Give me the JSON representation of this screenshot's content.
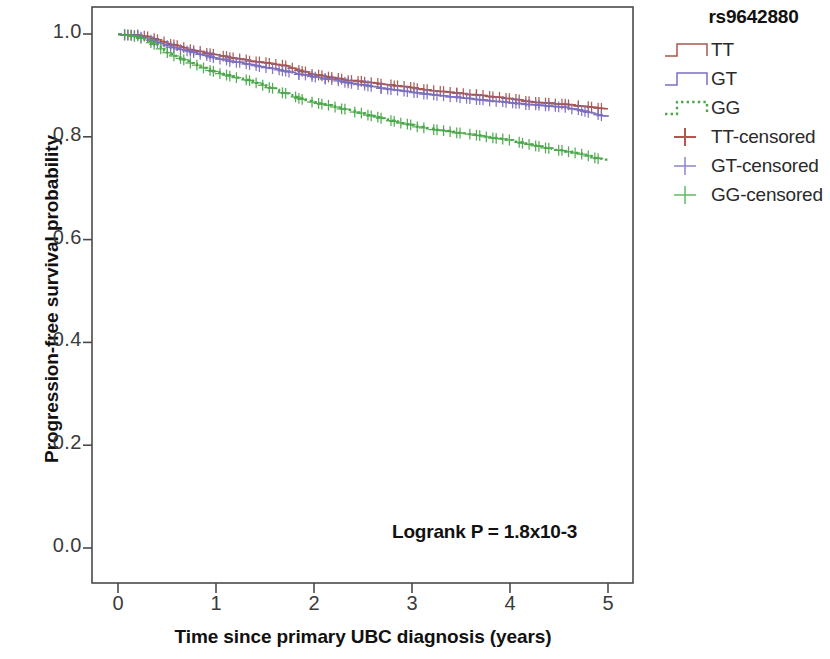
{
  "chart_data": {
    "type": "line",
    "subtype": "kaplan-meier-survival",
    "title": "",
    "xlabel": "Time since primary UBC diagnosis (years)",
    "ylabel": "Progression-free survival probability",
    "xlim": [
      0,
      5
    ],
    "ylim": [
      0.0,
      1.0
    ],
    "xticks": [
      "0",
      "1",
      "2",
      "3",
      "4",
      "5"
    ],
    "yticks": [
      "0.0",
      "0.2",
      "0.4",
      "0.6",
      "0.8",
      "1.0"
    ],
    "grid": false,
    "legend_position": "right",
    "annotation": "Logrank P = 1.8x10-3",
    "legend_title": "rs9642880",
    "series": [
      {
        "name": "TT",
        "color": "#a8554e",
        "style": "solid-step",
        "x": [
          0.0,
          0.18,
          0.3,
          0.42,
          0.55,
          0.7,
          0.85,
          1.0,
          1.15,
          1.3,
          1.45,
          1.6,
          1.72,
          1.85,
          2.0,
          2.15,
          2.3,
          2.45,
          2.6,
          2.75,
          2.9,
          3.05,
          3.2,
          3.35,
          3.5,
          3.65,
          3.8,
          3.95,
          4.1,
          4.25,
          4.4,
          4.55,
          4.7,
          4.85,
          5.0
        ],
        "y": [
          1.0,
          1.0,
          0.995,
          0.988,
          0.98,
          0.972,
          0.966,
          0.96,
          0.955,
          0.95,
          0.946,
          0.942,
          0.938,
          0.93,
          0.922,
          0.917,
          0.912,
          0.909,
          0.906,
          0.902,
          0.899,
          0.895,
          0.891,
          0.888,
          0.885,
          0.882,
          0.879,
          0.876,
          0.872,
          0.868,
          0.866,
          0.864,
          0.861,
          0.858,
          0.855
        ]
      },
      {
        "name": "GT",
        "color": "#7b6fc0",
        "style": "solid-step",
        "x": [
          0.0,
          0.18,
          0.3,
          0.42,
          0.55,
          0.7,
          0.85,
          1.0,
          1.15,
          1.3,
          1.45,
          1.6,
          1.72,
          1.85,
          2.0,
          2.15,
          2.3,
          2.45,
          2.6,
          2.75,
          2.9,
          3.05,
          3.2,
          3.35,
          3.5,
          3.65,
          3.8,
          3.95,
          4.1,
          4.25,
          4.4,
          4.55,
          4.7,
          4.85,
          5.0
        ],
        "y": [
          1.0,
          0.998,
          0.992,
          0.983,
          0.975,
          0.968,
          0.961,
          0.954,
          0.948,
          0.943,
          0.938,
          0.933,
          0.928,
          0.923,
          0.918,
          0.913,
          0.908,
          0.903,
          0.898,
          0.894,
          0.89,
          0.886,
          0.883,
          0.88,
          0.877,
          0.874,
          0.871,
          0.868,
          0.865,
          0.863,
          0.861,
          0.858,
          0.853,
          0.846,
          0.84
        ]
      },
      {
        "name": "GG",
        "color": "#4aa84a",
        "style": "dotted-step",
        "x": [
          0.0,
          0.18,
          0.3,
          0.42,
          0.55,
          0.7,
          0.85,
          1.0,
          1.15,
          1.3,
          1.45,
          1.6,
          1.72,
          1.85,
          2.0,
          2.15,
          2.3,
          2.45,
          2.6,
          2.75,
          2.9,
          3.05,
          3.2,
          3.35,
          3.5,
          3.65,
          3.8,
          3.95,
          4.1,
          4.25,
          4.4,
          4.55,
          4.7,
          4.85,
          5.0
        ],
        "y": [
          1.0,
          0.996,
          0.988,
          0.974,
          0.96,
          0.948,
          0.937,
          0.926,
          0.919,
          0.912,
          0.903,
          0.893,
          0.884,
          0.876,
          0.868,
          0.862,
          0.855,
          0.848,
          0.841,
          0.834,
          0.827,
          0.821,
          0.816,
          0.812,
          0.808,
          0.804,
          0.8,
          0.796,
          0.79,
          0.784,
          0.778,
          0.773,
          0.768,
          0.761,
          0.755
        ]
      }
    ],
    "censored_markers": {
      "symbol": "+",
      "TT_count": 95,
      "GT_count": 95,
      "GG_count": 80
    }
  },
  "axes": {
    "y_title": "Progression-free survival probability",
    "x_title": "Time since primary UBC diagnosis (years)",
    "y_ticks": [
      {
        "label": "1.0",
        "value": 1.0
      },
      {
        "label": "0.8",
        "value": 0.8
      },
      {
        "label": "0.6",
        "value": 0.6
      },
      {
        "label": "0.4",
        "value": 0.4
      },
      {
        "label": "0.2",
        "value": 0.2
      },
      {
        "label": "0.0",
        "value": 0.0
      }
    ],
    "x_ticks": [
      {
        "label": "0",
        "value": 0
      },
      {
        "label": "1",
        "value": 1
      },
      {
        "label": "2",
        "value": 2
      },
      {
        "label": "3",
        "value": 3
      },
      {
        "label": "4",
        "value": 4
      },
      {
        "label": "5",
        "value": 5
      }
    ]
  },
  "annotation": {
    "logrank": "Logrank P = 1.8x10-3"
  },
  "legend": {
    "title": "rs9642880",
    "items": [
      {
        "label": "TT",
        "color": "#a8554e",
        "key": "step-line"
      },
      {
        "label": "GT",
        "color": "#7b6fc0",
        "key": "step-line"
      },
      {
        "label": "GG",
        "color": "#4aa84a",
        "key": "dotted-step-line"
      },
      {
        "label": "TT-censored",
        "color": "#b4554e",
        "key": "plus-marker"
      },
      {
        "label": "GT-censored",
        "color": "#8b84cc",
        "key": "plus-marker"
      },
      {
        "label": "GG-censored",
        "color": "#62bb62",
        "key": "plus-marker"
      }
    ]
  },
  "colors": {
    "tt": "#a8554e",
    "gt": "#7b6fc0",
    "gg": "#4aa84a",
    "axis": "#555555",
    "text": "#1a1a1a"
  }
}
